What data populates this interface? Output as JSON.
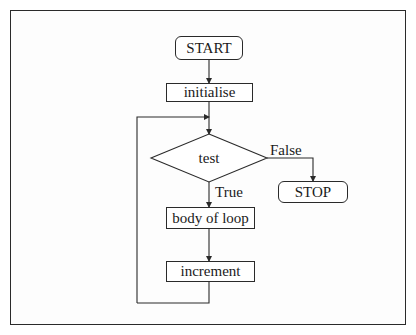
{
  "flowchart": {
    "title": "",
    "nodes": {
      "start": {
        "label": "START",
        "shape": "terminal"
      },
      "initialise": {
        "label": "initialise",
        "shape": "process"
      },
      "test": {
        "label": "test",
        "shape": "decision"
      },
      "stop": {
        "label": "STOP",
        "shape": "terminal"
      },
      "body": {
        "label": "body of loop",
        "shape": "process"
      },
      "increment": {
        "label": "increment",
        "shape": "process"
      }
    },
    "edges": [
      {
        "from": "START",
        "to": "initialise",
        "label": ""
      },
      {
        "from": "initialise",
        "to": "test",
        "label": ""
      },
      {
        "from": "test",
        "to": "STOP",
        "label": "False"
      },
      {
        "from": "test",
        "to": "body of loop",
        "label": "True"
      },
      {
        "from": "body of loop",
        "to": "increment",
        "label": ""
      },
      {
        "from": "increment",
        "to": "test",
        "label": ""
      }
    ],
    "edge_labels": {
      "false": "False",
      "true": "True"
    }
  },
  "colors": {
    "line": "#2a2a2a",
    "background": "#ffffff"
  }
}
